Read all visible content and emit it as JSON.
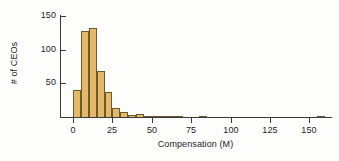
{
  "chart_data": {
    "type": "bar",
    "title": "",
    "subtitle": "",
    "xlabel": "Compensation (M)",
    "ylabel": "# of CEOs",
    "xlim": [
      0,
      172
    ],
    "ylim": [
      0,
      150
    ],
    "grid": false,
    "legend": null,
    "bin_width": 5,
    "x_ticks": [
      0,
      25,
      50,
      75,
      100,
      125,
      150
    ],
    "x_tick_labels": [
      "0",
      "25",
      "50",
      "75",
      "100",
      "125",
      "150"
    ],
    "y_ticks": [
      50,
      100,
      150
    ],
    "y_tick_labels": [
      "50",
      "100",
      "150"
    ],
    "bar_fill": "#e5b96a",
    "bar_edge": "#6b5a2e",
    "axis_color": "#3a3a38",
    "bins": [
      {
        "start": 0,
        "end": 5,
        "count": 40
      },
      {
        "start": 5,
        "end": 10,
        "count": 127
      },
      {
        "start": 10,
        "end": 15,
        "count": 132
      },
      {
        "start": 15,
        "end": 20,
        "count": 69
      },
      {
        "start": 20,
        "end": 25,
        "count": 37
      },
      {
        "start": 25,
        "end": 30,
        "count": 14
      },
      {
        "start": 30,
        "end": 35,
        "count": 8
      },
      {
        "start": 35,
        "end": 40,
        "count": 3
      },
      {
        "start": 40,
        "end": 45,
        "count": 4
      },
      {
        "start": 45,
        "end": 50,
        "count": 2
      },
      {
        "start": 50,
        "end": 55,
        "count": 1
      },
      {
        "start": 55,
        "end": 60,
        "count": 1
      },
      {
        "start": 60,
        "end": 65,
        "count": 1
      },
      {
        "start": 65,
        "end": 70,
        "count": 1
      },
      {
        "start": 80,
        "end": 85,
        "count": 1
      },
      {
        "start": 155,
        "end": 160,
        "count": 2
      }
    ],
    "categories": [
      "0-5",
      "5-10",
      "10-15",
      "15-20",
      "20-25",
      "25-30",
      "30-35",
      "35-40",
      "40-45",
      "45-50",
      "50-55",
      "55-60",
      "60-65",
      "65-70",
      "80-85",
      "155-160"
    ],
    "values": [
      40,
      127,
      132,
      69,
      37,
      14,
      8,
      3,
      4,
      2,
      1,
      1,
      1,
      1,
      1,
      2
    ]
  }
}
